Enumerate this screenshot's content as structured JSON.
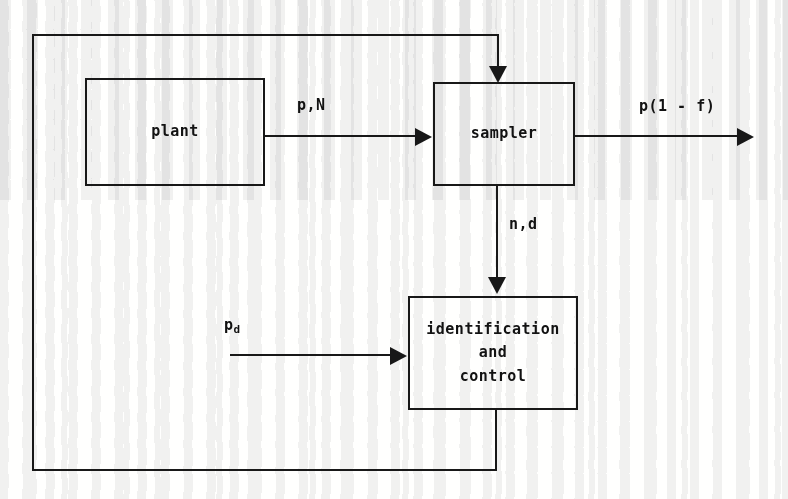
{
  "diagram": {
    "ink_color": "#1a1a1a",
    "paper_color": "#fdfdfc",
    "blocks": [
      {
        "id": "plant",
        "label": "plant"
      },
      {
        "id": "sampler",
        "label": "sampler"
      },
      {
        "id": "identification-and-control",
        "label": "identification\nand\ncontrol"
      }
    ],
    "signals": [
      {
        "id": "plant-to-sampler",
        "label": "p,N",
        "from": "plant",
        "to": "sampler"
      },
      {
        "id": "sampler-output",
        "label": "p(1 - f)",
        "from": "sampler",
        "to": "output"
      },
      {
        "id": "sampler-to-identification",
        "label": "n,d",
        "from": "sampler",
        "to": "identification-and-control"
      },
      {
        "id": "desired-input",
        "label_base": "p",
        "label_sub": "d",
        "from": "input",
        "to": "identification-and-control"
      },
      {
        "id": "feedback-loop",
        "label": "",
        "from": "identification-and-control",
        "to": "sampler"
      }
    ]
  }
}
